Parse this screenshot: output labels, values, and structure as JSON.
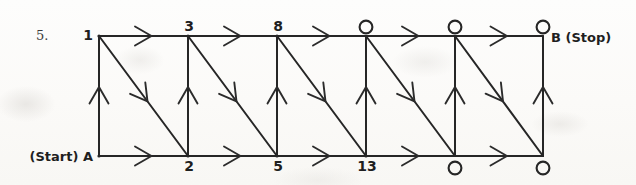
{
  "problem_number": "5.",
  "colors": {
    "ink": "#262626",
    "paper": "#fdfcfb"
  },
  "diagram": {
    "type": "lattice-path-counting-graph",
    "columns_x": [
      99,
      188,
      277,
      366,
      455,
      543
    ],
    "row_y": {
      "top": 36,
      "bottom": 156
    },
    "end_label": "B (Stop)",
    "top_nodes": [
      {
        "shape": "vertex",
        "label": "1",
        "label_pos": "left"
      },
      {
        "shape": "vertex",
        "label": "3",
        "label_pos": "above"
      },
      {
        "shape": "vertex",
        "label": "8",
        "label_pos": "above"
      },
      {
        "shape": "circle",
        "label": "",
        "label_pos": "above"
      },
      {
        "shape": "circle",
        "label": "",
        "label_pos": "above"
      },
      {
        "shape": "circle",
        "label": "",
        "label_pos": "above"
      }
    ],
    "bottom_nodes": [
      {
        "shape": "vertex",
        "label": "(Start) A",
        "label_pos": "left"
      },
      {
        "shape": "vertex",
        "label": "2",
        "label_pos": "below"
      },
      {
        "shape": "vertex",
        "label": "5",
        "label_pos": "below"
      },
      {
        "shape": "vertex",
        "label": "13",
        "label_pos": "below"
      },
      {
        "shape": "circle",
        "label": "",
        "label_pos": "below"
      },
      {
        "shape": "circle",
        "label": "",
        "label_pos": "below"
      }
    ],
    "edges": {
      "top_horizontal": {
        "count": 5,
        "direction": "right",
        "arrow": "open-chevron"
      },
      "bottom_horizontal": {
        "count": 5,
        "direction": "right",
        "arrow": "open-chevron"
      },
      "vertical": {
        "count": 6,
        "direction": "up",
        "arrow": "open-chevron"
      },
      "diagonal": {
        "count": 5,
        "direction": "down-right",
        "arrow": "open-chevron"
      }
    }
  }
}
